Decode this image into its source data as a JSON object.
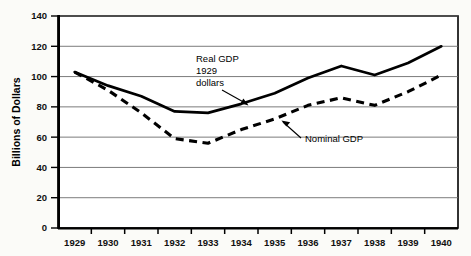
{
  "chart_data": {
    "type": "line",
    "title": "",
    "xlabel": "",
    "ylabel": "Billions of Dollars",
    "ylim": [
      0,
      140
    ],
    "yticks": [
      0,
      20,
      40,
      60,
      80,
      100,
      120,
      140
    ],
    "grid": true,
    "legend_position": "inline-annotations",
    "x": [
      1929,
      1930,
      1931,
      1932,
      1933,
      1934,
      1935,
      1936,
      1937,
      1938,
      1939,
      1940
    ],
    "categories": [
      "1929",
      "1930",
      "1931",
      "1932",
      "1933",
      "1934",
      "1935",
      "1936",
      "1937",
      "1938",
      "1939",
      "1940"
    ],
    "series": [
      {
        "name": "Real GDP 1929 dollars",
        "style": "solid",
        "color": "#000000",
        "values": [
          103,
          94,
          87,
          77,
          76,
          82,
          89,
          99,
          107,
          101,
          109,
          120
        ]
      },
      {
        "name": "Nominal GDP",
        "style": "dashed",
        "color": "#000000",
        "values": [
          103,
          91,
          76,
          59,
          56,
          65,
          72,
          81,
          86,
          81,
          90,
          101
        ]
      }
    ],
    "annotations": [
      {
        "id": "real-gdp-annotation",
        "lines": [
          "Real GDP",
          "1929",
          "dollars"
        ],
        "arrow": "down-right"
      },
      {
        "id": "nominal-gdp-annotation",
        "lines": [
          "Nominal GDP"
        ],
        "arrow": "up-left"
      }
    ]
  },
  "axes": {
    "y_title": "Billions of Dollars",
    "y_tick_labels": [
      "140",
      "120",
      "100",
      "80",
      "60",
      "40",
      "20",
      "0"
    ],
    "x_tick_labels": [
      "1929",
      "1930",
      "1931",
      "1932",
      "1933",
      "1934",
      "1935",
      "1936",
      "1937",
      "1938",
      "1939",
      "1940"
    ]
  },
  "annotations": {
    "real_gdp_line1": "Real GDP",
    "real_gdp_line2": "1929",
    "real_gdp_line3": "dollars",
    "nominal_gdp": "Nominal GDP"
  }
}
